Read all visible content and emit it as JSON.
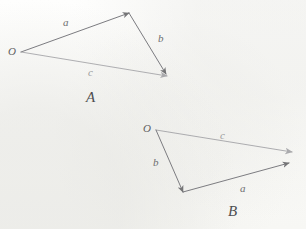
{
  "page": {
    "background_color": "#fdfdfb",
    "width": 306,
    "height": 229
  },
  "figures": [
    {
      "id": "figure-a",
      "caption": "A",
      "caption_pos": {
        "x": 86,
        "y": 90
      },
      "origin_label": "O",
      "origin_label_pos": {
        "x": 8,
        "y": 46
      },
      "origin_point": {
        "x": 21,
        "y": 52
      },
      "vectors": [
        {
          "name": "a",
          "label": "a",
          "label_pos": {
            "x": 63,
            "y": 17
          },
          "from": {
            "x": 21,
            "y": 52
          },
          "to": {
            "x": 129,
            "y": 13
          },
          "color": "#75757a",
          "width": 1.0,
          "opacity": 0.95
        },
        {
          "name": "b",
          "label": "b",
          "label_pos": {
            "x": 158,
            "y": 33
          },
          "from": {
            "x": 129,
            "y": 13
          },
          "to": {
            "x": 166,
            "y": 74
          },
          "color": "#75757a",
          "width": 1.0,
          "opacity": 0.95
        },
        {
          "name": "c",
          "label": "c",
          "label_pos": {
            "x": 88,
            "y": 67
          },
          "from": {
            "x": 21,
            "y": 52
          },
          "to": {
            "x": 167,
            "y": 76
          },
          "color": "#a2a2a6",
          "width": 1.0,
          "opacity": 0.85
        }
      ]
    },
    {
      "id": "figure-b",
      "caption": "B",
      "caption_pos": {
        "x": 228,
        "y": 204
      },
      "origin_label": "O",
      "origin_label_pos": {
        "x": 143,
        "y": 123
      },
      "origin_point": {
        "x": 156,
        "y": 130
      },
      "vectors": [
        {
          "name": "c",
          "label": "c",
          "label_pos": {
            "x": 220,
            "y": 130
          },
          "from": {
            "x": 156,
            "y": 130
          },
          "to": {
            "x": 292,
            "y": 152
          },
          "color": "#a0a0a4",
          "width": 1.0,
          "opacity": 0.85
        },
        {
          "name": "b",
          "label": "b",
          "label_pos": {
            "x": 153,
            "y": 157
          },
          "from": {
            "x": 156,
            "y": 130
          },
          "to": {
            "x": 183,
            "y": 192
          },
          "color": "#76767b",
          "width": 1.0,
          "opacity": 0.95
        },
        {
          "name": "a",
          "label": "a",
          "label_pos": {
            "x": 240,
            "y": 183
          },
          "from": {
            "x": 183,
            "y": 192
          },
          "to": {
            "x": 289,
            "y": 163
          },
          "color": "#76767b",
          "width": 1.0,
          "opacity": 0.95
        }
      ]
    }
  ],
  "colors": {
    "ink_dark": "#6e6e70",
    "ink_light": "#a2a2a6",
    "caption_ink": "#4e4e51",
    "paper": "#fdfdfb"
  }
}
